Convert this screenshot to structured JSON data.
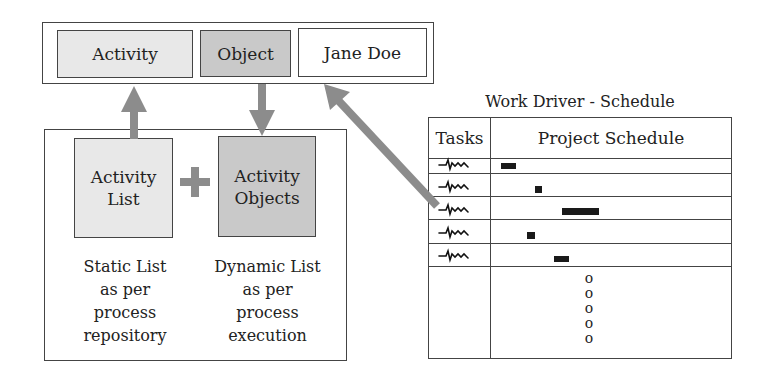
{
  "top_bar": {
    "items": [
      {
        "label": "Activity",
        "fill": "#e8e8e8"
      },
      {
        "label": "Object",
        "fill": "#c9c9c9"
      },
      {
        "label": "Jane Doe",
        "fill": "#ffffff"
      }
    ]
  },
  "composition": {
    "left_box": {
      "label_line1": "Activity",
      "label_line2": "List"
    },
    "operator": "+",
    "right_box": {
      "label_line1": "Activity",
      "label_line2": "Objects"
    },
    "left_desc": [
      "Static List",
      "as per",
      "process",
      "repository"
    ],
    "right_desc": [
      "Dynamic List",
      "as per",
      "process",
      "execution"
    ]
  },
  "schedule": {
    "title": "Work Driver - Schedule",
    "columns": [
      "Tasks",
      "Project Schedule"
    ],
    "rows": [
      {
        "task": "scribble",
        "bar": {
          "x": 501,
          "w": 15
        }
      },
      {
        "task": "scribble",
        "bar": {
          "x": 535,
          "w": 7
        }
      },
      {
        "task": "scribble",
        "bar": {
          "x": 562,
          "w": 37
        }
      },
      {
        "task": "scribble",
        "bar": {
          "x": 527,
          "w": 8
        }
      },
      {
        "task": "scribble",
        "bar": {
          "x": 554,
          "w": 15
        }
      }
    ],
    "continuation": [
      "o",
      "o",
      "o",
      "o",
      "o"
    ]
  },
  "colors": {
    "arrow": "#8c8c8c",
    "border": "#444444",
    "bar": "#1a1a1a"
  }
}
